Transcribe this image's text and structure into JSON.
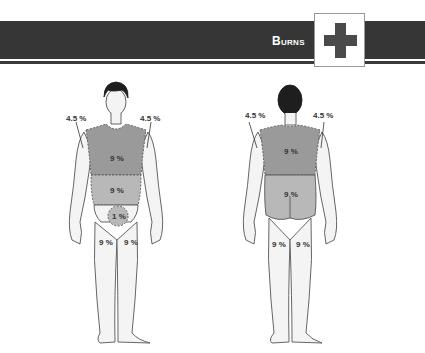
{
  "header": {
    "title": "Burns",
    "icon": "first-aid-cross-icon"
  },
  "figures": {
    "front": {
      "left_arm": "4.5 %",
      "right_arm": "4.5 %",
      "chest": "9 %",
      "abdomen": "9 %",
      "groin": "1 %",
      "left_leg": "9 %",
      "right_leg": "9 %"
    },
    "back": {
      "left_arm": "4.5 %",
      "right_arm": "4.5 %",
      "upper_back": "9 %",
      "lower_back": "9 %",
      "left_leg": "9 %",
      "right_leg": "9 %"
    }
  },
  "colors": {
    "banner": "#363636",
    "chest_shade": "#9a9a9a",
    "abdomen_shade": "#b8b8b8",
    "skin": "#f4f4f4",
    "hair": "#1e1e1e"
  }
}
